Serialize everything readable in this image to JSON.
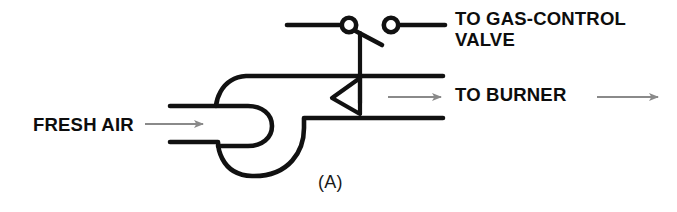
{
  "figure": {
    "caption": "(A)",
    "title_labels": {
      "gas_control_valve": "TO GAS-CONTROL\nVALVE",
      "to_burner": "TO BURNER",
      "fresh_air": "FRESH AIR"
    }
  },
  "colors": {
    "line": "#111111",
    "arrow": "#8a8a8a",
    "background": "#ffffff",
    "text": "#0d0d0d"
  },
  "diagram": {
    "type": "sail-switch-blower-schematic",
    "components": [
      {
        "name": "blower-volute-housing",
        "description": "Centrifugal blower scroll housing",
        "center_x": 262,
        "center_y": 130,
        "radius": 42
      },
      {
        "name": "fresh-air-duct",
        "description": "Horizontal inlet duct at left",
        "top_y": 106,
        "bottom_y": 142,
        "start_x": 170,
        "end_x": 248
      },
      {
        "name": "burner-duct",
        "description": "Horizontal outlet duct at right",
        "top_y": 76,
        "bottom_y": 118,
        "start_x": 262,
        "end_x": 443
      },
      {
        "name": "sail-vane",
        "description": "Triangular sail flag in airstream pointing left",
        "apex_x": 332,
        "apex_y": 98,
        "rod_x": 360
      },
      {
        "name": "switch-linkage-rod",
        "description": "Vertical rod from sail vane to switch arm",
        "x": 360,
        "top_y": 33,
        "bottom_y": 103
      },
      {
        "name": "switch-contact-left",
        "cx": 349,
        "cy": 25,
        "r": 7
      },
      {
        "name": "switch-contact-right",
        "cx": 391,
        "cy": 25,
        "r": 7
      },
      {
        "name": "switch-arm",
        "description": "Pivoting arm between the two contacts",
        "from_x": 349,
        "from_y": 25,
        "to_x": 381,
        "to_y": 44
      },
      {
        "name": "wire-left",
        "start_x": 287,
        "end_x": 342,
        "y": 25
      },
      {
        "name": "wire-right",
        "start_x": 398,
        "end_x": 445,
        "y": 25
      }
    ],
    "arrows": [
      {
        "name": "fresh-air-flow-arrow",
        "start_x": 145,
        "end_x": 205,
        "y": 124
      },
      {
        "name": "burner-flow-arrow-inner",
        "start_x": 388,
        "end_x": 443,
        "y": 97
      },
      {
        "name": "burner-flow-arrow-outer",
        "start_x": 597,
        "end_x": 660,
        "y": 97
      }
    ]
  }
}
